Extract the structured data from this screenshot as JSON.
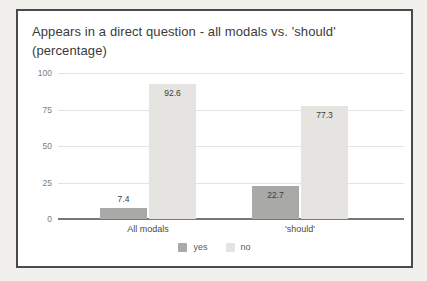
{
  "chart_data": {
    "type": "bar",
    "title": "Appears in a direct question - all modals vs. 'should' (percentage)",
    "categories": [
      "All modals",
      "'should'"
    ],
    "series": [
      {
        "name": "yes",
        "color": "#a9a9a7",
        "values": [
          7.4,
          22.7
        ]
      },
      {
        "name": "no",
        "color": "#e5e4e0",
        "values": [
          92.6,
          77.3
        ]
      }
    ],
    "value_labels": [
      "7.4",
      "92.6",
      "22.7",
      "77.3"
    ],
    "xlabel": "",
    "ylabel": "",
    "ylim": [
      0,
      100
    ],
    "yticks": [
      "0",
      "25",
      "50",
      "75",
      "100"
    ],
    "grid": true,
    "legend_position": "bottom"
  },
  "colors": {
    "paper_background": "#f1f0ec",
    "card_background": "#ffffff",
    "card_border": "#4a4a4a",
    "gridline": "#e3e3e3",
    "axis_line": "#777777",
    "title_text": "#3b3b3b",
    "tick_text": "#7d7d7d"
  }
}
